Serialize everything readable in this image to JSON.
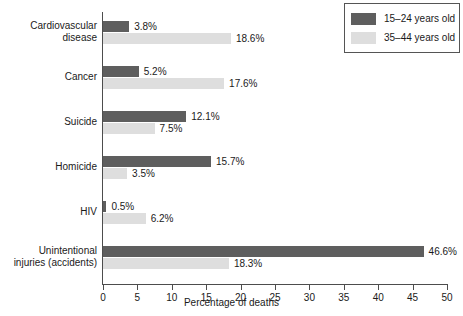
{
  "chart_data": {
    "type": "bar",
    "orientation": "horizontal",
    "title": "",
    "xlabel": "Percentage of deaths",
    "ylabel": "",
    "xlim": [
      0,
      50
    ],
    "xticks": [
      0,
      5,
      10,
      15,
      20,
      25,
      30,
      35,
      40,
      45,
      50
    ],
    "xtick_labels": [
      "0",
      "5",
      "10",
      "15",
      "20",
      "25",
      "30",
      "35",
      "40",
      "45",
      "50"
    ],
    "grid": false,
    "legend_position": "top-right",
    "categories": [
      "Cardiovascular\ndisease",
      "Cancer",
      "Suicide",
      "Homicide",
      "HIV",
      "Unintentional\ninjuries (accidents)"
    ],
    "series": [
      {
        "name": "15–24 years old",
        "color": "#5e5e5e",
        "values": [
          3.8,
          5.2,
          12.1,
          15.7,
          0.5,
          46.6
        ],
        "value_labels": [
          "3.8%",
          "5.2%",
          "12.1%",
          "15.7%",
          "0.5%",
          "46.6%"
        ]
      },
      {
        "name": "35–44 years old",
        "color": "#dedede",
        "values": [
          18.6,
          17.6,
          7.5,
          3.5,
          6.2,
          18.3
        ],
        "value_labels": [
          "18.6%",
          "17.6%",
          "7.5%",
          "3.5%",
          "6.2%",
          "18.3%"
        ]
      }
    ]
  },
  "legend": {
    "entries": [
      {
        "label": "15–24 years old",
        "color": "#5e5e5e"
      },
      {
        "label": "35–44 years old",
        "color": "#dedede"
      }
    ]
  },
  "axis": {
    "x_title": "Percentage of deaths"
  }
}
